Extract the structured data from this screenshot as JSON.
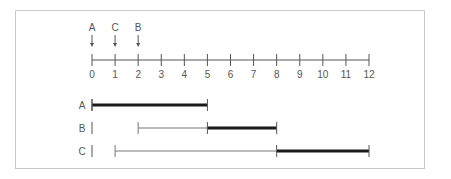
{
  "chart_data": {
    "type": "timeline",
    "axis": {
      "min": 0,
      "max": 12,
      "ticks": [
        0,
        1,
        2,
        3,
        4,
        5,
        6,
        7,
        8,
        9,
        10,
        11,
        12
      ],
      "tick_labels": [
        "0",
        "1",
        "2",
        "3",
        "4",
        "5",
        "6",
        "7",
        "8",
        "9",
        "10",
        "11",
        "12"
      ]
    },
    "markers": [
      {
        "label": "A",
        "at": 0
      },
      {
        "label": "C",
        "at": 1
      },
      {
        "label": "B",
        "at": 2
      }
    ],
    "rows": [
      {
        "label": "A",
        "arrival": 0,
        "wait_start": null,
        "wait_end": null,
        "run_start": 0,
        "run_end": 5
      },
      {
        "label": "B",
        "arrival": 2,
        "wait_start": 2,
        "wait_end": 5,
        "run_start": 5,
        "run_end": 8
      },
      {
        "label": "C",
        "arrival": 1,
        "wait_start": 1,
        "wait_end": 8,
        "run_start": 8,
        "run_end": 12
      }
    ]
  },
  "colors": {
    "frame": "#c8c8c8",
    "axis": "#555555",
    "thin_line": "#777777",
    "thick_bar": "#1a1a1a",
    "text": "#555555"
  }
}
